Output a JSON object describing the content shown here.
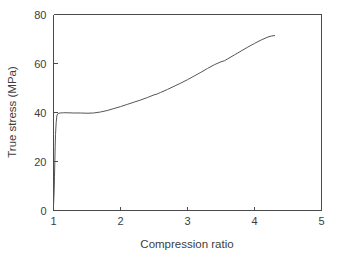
{
  "chart_data": {
    "type": "line",
    "title": "",
    "subtitle": "",
    "xlabel": "Compression ratio",
    "ylabel": "True stress (MPa)",
    "xlim": [
      1,
      5
    ],
    "ylim": [
      0,
      80
    ],
    "xticks": [
      "1",
      "2",
      "3",
      "4",
      "5"
    ],
    "xtick_values": [
      1,
      2,
      3,
      4,
      5
    ],
    "yticks": [
      "0",
      "20",
      "40",
      "60",
      "80"
    ],
    "ytick_values": [
      0,
      20,
      40,
      60,
      80
    ],
    "grid": false,
    "legend": null,
    "legend_position": "none",
    "annotations": [],
    "series": [
      {
        "name": "true stress",
        "color": "#555555",
        "x": [
          1.0,
          1.01,
          1.015,
          1.02,
          1.025,
          1.03,
          1.04,
          1.05,
          1.06,
          1.08,
          1.1,
          1.15,
          1.2,
          1.3,
          1.4,
          1.5,
          1.6,
          1.7,
          1.8,
          1.9,
          2.0,
          2.1,
          2.2,
          2.3,
          2.4,
          2.5,
          2.55,
          2.6,
          2.7,
          2.8,
          2.9,
          3.0,
          3.1,
          3.2,
          3.3,
          3.4,
          3.5,
          3.55,
          3.6,
          3.7,
          3.8,
          3.9,
          4.0,
          4.1,
          4.2,
          4.25,
          4.3
        ],
        "y": [
          1.5,
          8.0,
          14.0,
          20.0,
          26.0,
          31.0,
          36.0,
          38.6,
          39.4,
          39.7,
          39.8,
          39.9,
          39.9,
          39.8,
          39.8,
          39.7,
          39.8,
          40.2,
          40.8,
          41.6,
          42.4,
          43.3,
          44.2,
          45.1,
          46.1,
          47.2,
          47.6,
          48.2,
          49.4,
          50.7,
          52.0,
          53.4,
          54.9,
          56.4,
          58.0,
          59.5,
          60.7,
          61.1,
          61.9,
          63.5,
          65.1,
          66.7,
          68.2,
          69.6,
          70.8,
          71.2,
          71.4
        ]
      }
    ]
  },
  "axes": {
    "x_title": "Compression ratio",
    "y_title": "True stress (MPa)"
  }
}
